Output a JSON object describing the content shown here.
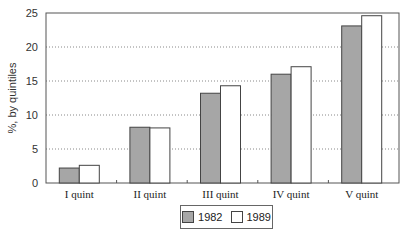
{
  "chart_data": {
    "type": "bar",
    "title": "",
    "xlabel": "",
    "ylabel": "%, by quintiles",
    "ylim": [
      0,
      25
    ],
    "yticks": [
      0,
      5,
      10,
      15,
      20,
      25
    ],
    "grid": true,
    "legend_position": "bottom",
    "categories": [
      "I quint",
      "II quint",
      "III quint",
      "IV quint",
      "V quint"
    ],
    "series": [
      {
        "name": "1982",
        "color": "#a6a6a6",
        "values": [
          2.2,
          8.2,
          13.2,
          16.0,
          23.1
        ]
      },
      {
        "name": "1989",
        "color": "#ffffff",
        "values": [
          2.6,
          8.1,
          14.3,
          17.1,
          24.6
        ]
      }
    ]
  },
  "legend": {
    "items": [
      {
        "label": "1982",
        "color": "#a6a6a6"
      },
      {
        "label": "1989",
        "color": "#ffffff"
      }
    ]
  }
}
